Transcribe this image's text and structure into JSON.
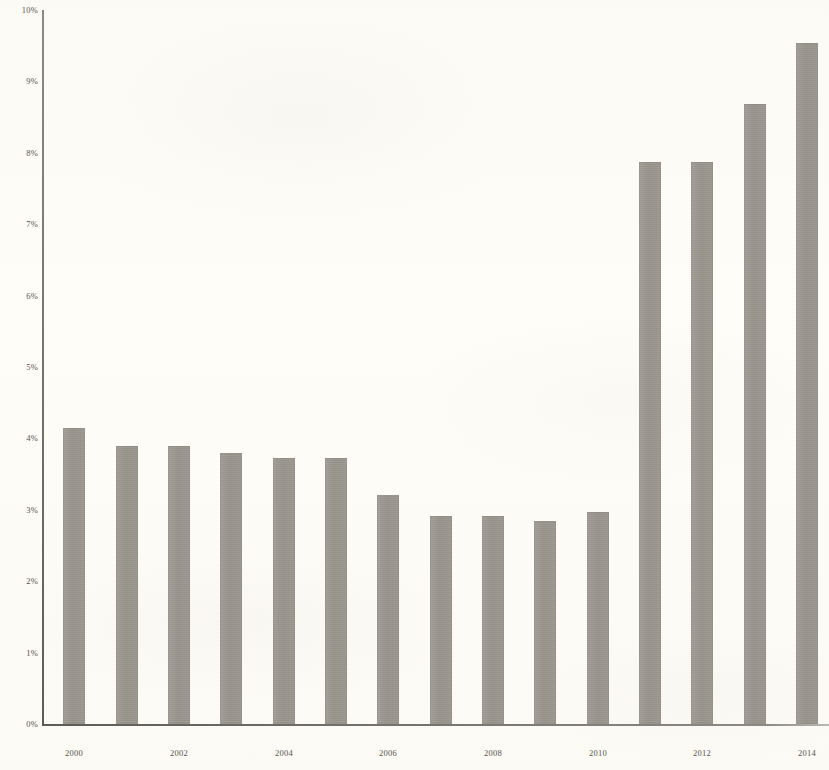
{
  "chart_data": {
    "type": "bar",
    "title": "",
    "subtitle": "",
    "xlabel": "",
    "ylabel": "",
    "categories": [
      "2000",
      "2001",
      "2002",
      "2003",
      "2004",
      "2005",
      "2006",
      "2007",
      "2008",
      "2009",
      "2010",
      "2011",
      "2012",
      "2013",
      "2014"
    ],
    "values": [
      4.14,
      3.9,
      3.89,
      3.8,
      3.73,
      3.73,
      3.21,
      2.91,
      2.91,
      2.84,
      2.97,
      7.87,
      7.87,
      8.69,
      9.54
    ],
    "series": [
      {
        "name": "",
        "values": [
          4.14,
          3.9,
          3.89,
          3.8,
          3.73,
          3.73,
          3.21,
          2.91,
          2.91,
          2.84,
          2.97,
          7.87,
          7.87,
          8.69,
          9.54
        ]
      }
    ],
    "ylim": [
      0,
      10
    ],
    "y_tick_values": [
      0,
      1,
      2,
      3,
      4,
      5,
      6,
      7,
      8,
      9,
      10
    ],
    "y_tick_labels": [
      "0%",
      "1%",
      "2%",
      "3%",
      "4%",
      "5%",
      "6%",
      "7%",
      "8%",
      "9%",
      "10%"
    ],
    "x_tick_labels": [
      "2000",
      "2002",
      "2004",
      "2006",
      "2008",
      "2010",
      "2012",
      "2014"
    ],
    "x_tick_categories": [
      "2000",
      "2002",
      "2004",
      "2006",
      "2008",
      "2010",
      "2012",
      "2014"
    ],
    "grid": false,
    "legend": null,
    "legend_position": "none",
    "annotations": [],
    "bar_color": "#9a968e",
    "axis_color": "#5d5c58",
    "background_color": "#fffdf8"
  }
}
